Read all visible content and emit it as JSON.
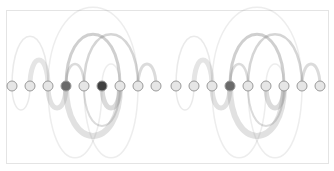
{
  "diagram": {
    "title": "",
    "type": "arc-diagram",
    "frame": {
      "x": 6,
      "y": 10,
      "width": 322,
      "height": 153,
      "stroke": "#e4e4e4"
    },
    "baseline_y": 86,
    "node_radius": 5,
    "colors": {
      "node_fill": "#e6e6e6",
      "node_stroke": "#9a9a9a",
      "node_dark": "#6a6a6a",
      "node_darker": "#404040",
      "arc": "#888888"
    },
    "groups": [
      {
        "name": "left",
        "nodes": [
          {
            "x": 12,
            "shade": "light"
          },
          {
            "x": 30,
            "shade": "light"
          },
          {
            "x": 48,
            "shade": "light"
          },
          {
            "x": 66,
            "shade": "dark"
          },
          {
            "x": 84,
            "shade": "light"
          },
          {
            "x": 102,
            "shade": "darker"
          },
          {
            "x": 120,
            "shade": "light"
          },
          {
            "x": 138,
            "shade": "light"
          },
          {
            "x": 156,
            "shade": "light"
          }
        ],
        "arcs_above": [
          {
            "from": 12,
            "to": 48,
            "h": 50,
            "w": 1.5,
            "o": 0.18
          },
          {
            "from": 30,
            "to": 48,
            "h": 26,
            "w": 5,
            "o": 0.22
          },
          {
            "from": 48,
            "to": 138,
            "h": 79,
            "w": 1.5,
            "o": 0.15
          },
          {
            "from": 66,
            "to": 84,
            "h": 22,
            "w": 2.5,
            "o": 0.3
          },
          {
            "from": 66,
            "to": 120,
            "h": 52,
            "w": 3,
            "o": 0.4
          },
          {
            "from": 84,
            "to": 138,
            "h": 52,
            "w": 2.5,
            "o": 0.35
          },
          {
            "from": 102,
            "to": 120,
            "h": 22,
            "w": 1.5,
            "o": 0.15
          },
          {
            "from": 138,
            "to": 156,
            "h": 22,
            "w": 3,
            "o": 0.3
          }
        ],
        "arcs_below": [
          {
            "from": 12,
            "to": 30,
            "h": 24,
            "w": 1.5,
            "o": 0.18
          },
          {
            "from": 48,
            "to": 66,
            "h": 22,
            "w": 5,
            "o": 0.25
          },
          {
            "from": 66,
            "to": 120,
            "h": 50,
            "w": 6,
            "o": 0.25
          },
          {
            "from": 84,
            "to": 120,
            "h": 40,
            "w": 2,
            "o": 0.3
          },
          {
            "from": 102,
            "to": 120,
            "h": 22,
            "w": 5,
            "o": 0.3
          },
          {
            "from": 48,
            "to": 102,
            "h": 72,
            "w": 1.5,
            "o": 0.15
          },
          {
            "from": 84,
            "to": 138,
            "h": 72,
            "w": 1.5,
            "o": 0.15
          }
        ]
      },
      {
        "name": "right",
        "nodes": [
          {
            "x": 176,
            "shade": "light"
          },
          {
            "x": 194,
            "shade": "light"
          },
          {
            "x": 212,
            "shade": "light"
          },
          {
            "x": 230,
            "shade": "dark"
          },
          {
            "x": 248,
            "shade": "light"
          },
          {
            "x": 266,
            "shade": "light"
          },
          {
            "x": 284,
            "shade": "light"
          },
          {
            "x": 302,
            "shade": "light"
          },
          {
            "x": 320,
            "shade": "light"
          }
        ],
        "arcs_above": [
          {
            "from": 176,
            "to": 212,
            "h": 50,
            "w": 1.5,
            "o": 0.18
          },
          {
            "from": 194,
            "to": 212,
            "h": 26,
            "w": 5,
            "o": 0.22
          },
          {
            "from": 212,
            "to": 302,
            "h": 79,
            "w": 1.5,
            "o": 0.15
          },
          {
            "from": 230,
            "to": 248,
            "h": 22,
            "w": 2.5,
            "o": 0.3
          },
          {
            "from": 230,
            "to": 284,
            "h": 52,
            "w": 3,
            "o": 0.4
          },
          {
            "from": 248,
            "to": 302,
            "h": 52,
            "w": 2.5,
            "o": 0.35
          },
          {
            "from": 266,
            "to": 284,
            "h": 22,
            "w": 1.5,
            "o": 0.15
          },
          {
            "from": 302,
            "to": 320,
            "h": 22,
            "w": 3,
            "o": 0.3
          }
        ],
        "arcs_below": [
          {
            "from": 176,
            "to": 194,
            "h": 24,
            "w": 1.5,
            "o": 0.18
          },
          {
            "from": 212,
            "to": 230,
            "h": 22,
            "w": 5,
            "o": 0.25
          },
          {
            "from": 230,
            "to": 284,
            "h": 50,
            "w": 6,
            "o": 0.25
          },
          {
            "from": 248,
            "to": 284,
            "h": 40,
            "w": 2,
            "o": 0.3
          },
          {
            "from": 266,
            "to": 284,
            "h": 22,
            "w": 5,
            "o": 0.3
          },
          {
            "from": 212,
            "to": 266,
            "h": 72,
            "w": 1.5,
            "o": 0.15
          },
          {
            "from": 248,
            "to": 302,
            "h": 72,
            "w": 1.5,
            "o": 0.15
          }
        ]
      }
    ]
  }
}
